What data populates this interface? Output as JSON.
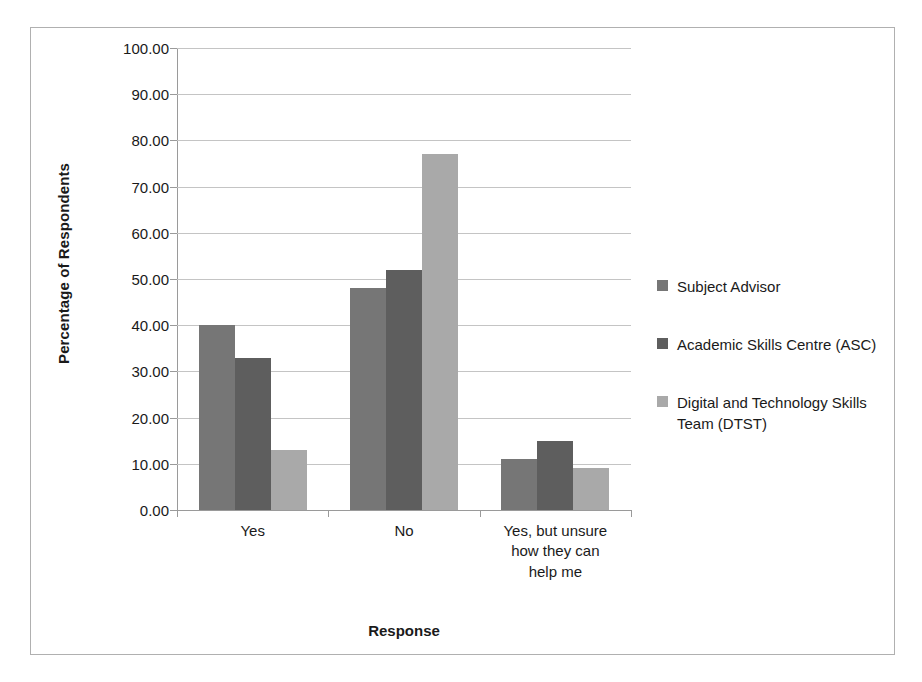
{
  "chart_data": {
    "type": "bar",
    "title": "",
    "subtitle": "",
    "xlabel": "Response",
    "ylabel": "Percentage of Respondents",
    "categories": [
      "Yes",
      "No",
      "Yes, but unsure how they can help me"
    ],
    "series": [
      {
        "name": "Subject Advisor",
        "values": [
          40,
          48,
          11
        ],
        "color": "#767676"
      },
      {
        "name": "Academic Skills Centre (ASC)",
        "values": [
          33,
          52,
          15
        ],
        "color": "#5e5e5e"
      },
      {
        "name": "Digital and Technology Skills Team (DTST)",
        "values": [
          13,
          77,
          9
        ],
        "color": "#a9a9a9"
      }
    ],
    "ylim": [
      0,
      100
    ],
    "ytick_step": 10,
    "ytick_labels": [
      "100.00",
      "90.00",
      "80.00",
      "70.00",
      "60.00",
      "50.00",
      "40.00",
      "30.00",
      "20.00",
      "10.00",
      "0.00"
    ],
    "ytick_values": [
      100,
      90,
      80,
      70,
      60,
      50,
      40,
      30,
      20,
      10,
      0
    ],
    "grid": "horizontal",
    "legend_position": "right",
    "category_label_lines": [
      [
        "Yes"
      ],
      [
        "No"
      ],
      [
        "Yes, but unsure",
        "how they can",
        "help me"
      ]
    ]
  }
}
